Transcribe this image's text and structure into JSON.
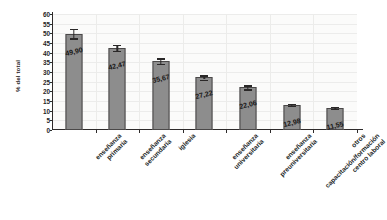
{
  "chart_data": {
    "type": "bar",
    "title": "",
    "xlabel": "",
    "ylabel": "% del total",
    "ylim": [
      0,
      60
    ],
    "ytick_step": 5,
    "yticks": [
      60,
      55,
      50,
      45,
      40,
      35,
      30,
      25,
      20,
      15,
      10,
      5,
      0
    ],
    "grid": "horizontal-and-vertical-faint",
    "legend": "none",
    "value_label_format": "comma-decimal",
    "categories": [
      "enseñanza primaria",
      "enseñanza secundaria",
      "iglesia",
      "enseñanza universitaria",
      "enseñanza preuniversitaria",
      "capacitación/formación centro laboral",
      "otros"
    ],
    "category_lines": [
      [
        "enseñanza",
        "primaria"
      ],
      [
        "enseñanza",
        "secundaria"
      ],
      [
        "iglesia"
      ],
      [
        "enseñanza",
        "universitaria"
      ],
      [
        "enseñanza",
        "preuniversitaria"
      ],
      [
        "capacitación/formación",
        "centro laboral"
      ],
      [
        "otros"
      ]
    ],
    "values": [
      49.9,
      42.47,
      35.67,
      27.22,
      22.06,
      12.98,
      11.55
    ],
    "value_labels": [
      "49,90",
      "42,47",
      "35,67",
      "27,22",
      "22,06",
      "12,98",
      "11,55"
    ],
    "errors": [
      2.4,
      1.6,
      1.5,
      1.1,
      1.0,
      0.6,
      0.6
    ],
    "bar_color": "#8d8d8d",
    "bar_edge_color": "#4a4848",
    "error_color": "#2a2828",
    "plot_background": "#fbfbfa",
    "grid_color": "#ececeb",
    "axis_color": "#2e2b2b",
    "text_color": "#201e1e"
  }
}
